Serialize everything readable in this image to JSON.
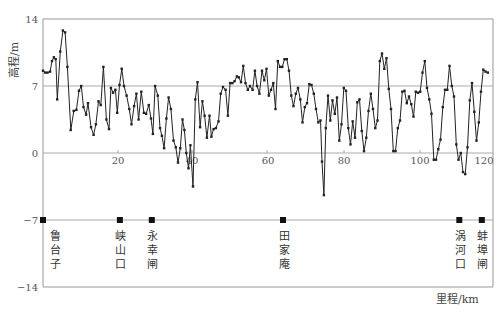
{
  "chart_data": {
    "type": "line",
    "title": "",
    "xlabel": "里程/km",
    "ylabel": "高程/m",
    "xlim": [
      0,
      120
    ],
    "ylim": [
      -14,
      14
    ],
    "x_ticks": [
      20,
      40,
      60,
      80,
      100,
      120
    ],
    "y_ticks": [
      14,
      7,
      0,
      -7,
      -14
    ],
    "grid": {
      "horizontal_lines_at": [
        7,
        0,
        -7
      ],
      "vertical": false
    },
    "legend": null,
    "series": [
      {
        "name": "河床高程",
        "color": "#222222",
        "marker": "square-dot",
        "points": [
          [
            0.0,
            8.6
          ],
          [
            0.6,
            8.4
          ],
          [
            1.2,
            8.4
          ],
          [
            1.9,
            8.5
          ],
          [
            2.4,
            9.6
          ],
          [
            2.9,
            10.0
          ],
          [
            3.4,
            9.8
          ],
          [
            3.8,
            5.6
          ],
          [
            4.6,
            10.6
          ],
          [
            5.3,
            12.8
          ],
          [
            5.9,
            12.6
          ],
          [
            6.5,
            9.0
          ],
          [
            7.4,
            2.4
          ],
          [
            8.2,
            4.4
          ],
          [
            8.9,
            4.5
          ],
          [
            9.6,
            6.5
          ],
          [
            10.2,
            7.0
          ],
          [
            10.8,
            4.8
          ],
          [
            11.5,
            4.0
          ],
          [
            12.0,
            5.2
          ],
          [
            12.8,
            2.7
          ],
          [
            13.5,
            1.9
          ],
          [
            14.1,
            3.0
          ],
          [
            14.8,
            5.4
          ],
          [
            15.4,
            5.0
          ],
          [
            16.1,
            9.0
          ],
          [
            16.9,
            3.5
          ],
          [
            17.6,
            2.5
          ],
          [
            18.1,
            6.8
          ],
          [
            18.7,
            6.3
          ],
          [
            19.3,
            6.6
          ],
          [
            19.8,
            4.2
          ],
          [
            20.4,
            7.1
          ],
          [
            21.0,
            8.8
          ],
          [
            21.6,
            7.0
          ],
          [
            22.3,
            6.0
          ],
          [
            23.0,
            4.6
          ],
          [
            23.6,
            3.0
          ],
          [
            24.3,
            4.9
          ],
          [
            24.9,
            6.2
          ],
          [
            25.5,
            3.5
          ],
          [
            26.2,
            6.4
          ],
          [
            26.9,
            4.2
          ],
          [
            27.5,
            4.1
          ],
          [
            28.2,
            5.0
          ],
          [
            28.8,
            3.6
          ],
          [
            29.3,
            2.0
          ],
          [
            29.9,
            7.0
          ],
          [
            30.6,
            6.0
          ],
          [
            31.2,
            2.6
          ],
          [
            31.7,
            1.8
          ],
          [
            32.3,
            0.5
          ],
          [
            32.9,
            3.6
          ],
          [
            33.5,
            5.8
          ],
          [
            34.1,
            4.6
          ],
          [
            34.8,
            1.3
          ],
          [
            35.4,
            0.6
          ],
          [
            36.0,
            -1.0
          ],
          [
            36.6,
            0.5
          ],
          [
            37.2,
            3.5
          ],
          [
            37.7,
            2.4
          ],
          [
            38.2,
            0.0
          ],
          [
            38.8,
            -1.6
          ],
          [
            39.3,
            0.8
          ],
          [
            40.0,
            -3.5
          ],
          [
            40.6,
            5.6
          ],
          [
            41.2,
            7.4
          ],
          [
            41.9,
            2.7
          ],
          [
            42.5,
            5.4
          ],
          [
            43.1,
            3.9
          ],
          [
            43.7,
            1.6
          ],
          [
            44.4,
            3.9
          ],
          [
            44.9,
            1.7
          ],
          [
            45.5,
            2.5
          ],
          [
            46.1,
            2.6
          ],
          [
            46.8,
            3.3
          ],
          [
            47.4,
            6.2
          ],
          [
            48.0,
            6.9
          ],
          [
            48.7,
            6.6
          ],
          [
            49.3,
            3.9
          ],
          [
            49.9,
            7.3
          ],
          [
            50.5,
            7.3
          ],
          [
            51.1,
            7.5
          ],
          [
            51.7,
            8.0
          ],
          [
            52.2,
            7.9
          ],
          [
            52.8,
            7.4
          ],
          [
            53.4,
            9.1
          ],
          [
            54.0,
            7.3
          ],
          [
            54.6,
            6.6
          ],
          [
            55.2,
            7.0
          ],
          [
            55.9,
            6.6
          ],
          [
            56.5,
            8.6
          ],
          [
            57.1,
            7.0
          ],
          [
            57.7,
            6.2
          ],
          [
            58.4,
            8.6
          ],
          [
            59.0,
            7.6
          ],
          [
            59.6,
            8.8
          ],
          [
            60.2,
            6.0
          ],
          [
            60.8,
            6.6
          ],
          [
            61.4,
            7.3
          ],
          [
            62.0,
            4.6
          ],
          [
            62.6,
            9.6
          ],
          [
            63.2,
            9.0
          ],
          [
            63.8,
            9.0
          ],
          [
            64.4,
            9.8
          ],
          [
            65.0,
            9.8
          ],
          [
            65.6,
            8.6
          ],
          [
            66.2,
            6.0
          ],
          [
            66.8,
            4.9
          ],
          [
            67.4,
            6.2
          ],
          [
            68.0,
            6.8
          ],
          [
            68.6,
            5.6
          ],
          [
            69.2,
            3.2
          ],
          [
            69.8,
            4.8
          ],
          [
            70.4,
            5.2
          ],
          [
            71.0,
            7.2
          ],
          [
            71.6,
            7.1
          ],
          [
            72.2,
            6.2
          ],
          [
            72.8,
            4.6
          ],
          [
            73.4,
            3.2
          ],
          [
            74.0,
            3.4
          ],
          [
            74.4,
            -0.9
          ],
          [
            74.9,
            -4.4
          ],
          [
            75.4,
            2.6
          ],
          [
            76.0,
            6.0
          ],
          [
            76.6,
            3.4
          ],
          [
            77.2,
            5.5
          ],
          [
            77.8,
            4.1
          ],
          [
            78.4,
            5.8
          ],
          [
            79.0,
            1.3
          ],
          [
            79.6,
            3.0
          ],
          [
            80.2,
            6.8
          ],
          [
            80.8,
            6.5
          ],
          [
            81.4,
            2.6
          ],
          [
            82.0,
            0.9
          ],
          [
            82.6,
            3.3
          ],
          [
            83.2,
            1.6
          ],
          [
            83.8,
            5.3
          ],
          [
            84.4,
            5.6
          ],
          [
            85.0,
            2.3
          ],
          [
            85.6,
            0.2
          ],
          [
            86.2,
            1.6
          ],
          [
            86.8,
            4.4
          ],
          [
            87.4,
            6.2
          ],
          [
            88.0,
            4.6
          ],
          [
            88.6,
            2.6
          ],
          [
            89.2,
            3.4
          ],
          [
            89.8,
            9.6
          ],
          [
            90.4,
            10.4
          ],
          [
            91.0,
            8.8
          ],
          [
            91.6,
            9.9
          ],
          [
            92.2,
            6.7
          ],
          [
            92.8,
            4.6
          ],
          [
            93.4,
            0.2
          ],
          [
            94.0,
            0.2
          ],
          [
            94.6,
            2.6
          ],
          [
            95.2,
            3.4
          ],
          [
            95.8,
            6.4
          ],
          [
            96.4,
            6.5
          ],
          [
            97.0,
            5.2
          ],
          [
            97.6,
            5.9
          ],
          [
            98.2,
            5.1
          ],
          [
            98.8,
            3.8
          ],
          [
            99.4,
            6.4
          ],
          [
            100.0,
            6.3
          ],
          [
            100.6,
            6.4
          ],
          [
            101.2,
            8.4
          ],
          [
            101.8,
            9.6
          ],
          [
            102.4,
            6.8
          ],
          [
            103.0,
            5.6
          ],
          [
            103.6,
            4.1
          ],
          [
            104.2,
            -0.7
          ],
          [
            104.8,
            -0.7
          ],
          [
            105.4,
            0.4
          ],
          [
            106.0,
            1.4
          ],
          [
            106.6,
            4.8
          ],
          [
            107.2,
            6.6
          ],
          [
            107.8,
            6.6
          ],
          [
            108.4,
            9.1
          ],
          [
            109.0,
            7.0
          ],
          [
            109.6,
            5.9
          ],
          [
            110.2,
            0.9
          ],
          [
            110.8,
            -0.7
          ],
          [
            111.4,
            0.0
          ],
          [
            112.0,
            -2.0
          ],
          [
            112.6,
            -2.2
          ],
          [
            113.2,
            0.6
          ],
          [
            113.8,
            5.5
          ],
          [
            114.4,
            7.3
          ],
          [
            115.0,
            4.3
          ],
          [
            115.6,
            1.3
          ],
          [
            116.2,
            3.2
          ],
          [
            116.8,
            6.4
          ],
          [
            117.4,
            8.7
          ],
          [
            118.0,
            8.5
          ],
          [
            118.6,
            8.4
          ]
        ]
      }
    ],
    "stations": [
      {
        "name": "鲁台子",
        "km": 0,
        "y": -7
      },
      {
        "name": "峡山口",
        "km": 20.5,
        "y": -7
      },
      {
        "name": "永幸闸",
        "km": 29,
        "y": -7
      },
      {
        "name": "田家庵",
        "km": 64,
        "y": -7
      },
      {
        "name": "涡河口",
        "km": 111,
        "y": -7
      },
      {
        "name": "蚌埠闸",
        "km": 117,
        "y": -7
      }
    ]
  },
  "labels": {
    "y_axis_title": "高程/m",
    "x_axis_title": "里程/km",
    "y_tick_14": "14",
    "y_tick_7": "7",
    "y_tick_0": "0",
    "y_tick_m7": "−7",
    "y_tick_m14": "−14",
    "x_tick_20": "20",
    "x_tick_40": "40",
    "x_tick_60": "60",
    "x_tick_80": "80",
    "x_tick_100": "100",
    "x_tick_120": "120",
    "station_0": "鲁台子",
    "station_1": "峡山口",
    "station_2": "永幸闸",
    "station_3": "田家庵",
    "station_4": "涡河口",
    "station_5": "蚌埠闸"
  }
}
